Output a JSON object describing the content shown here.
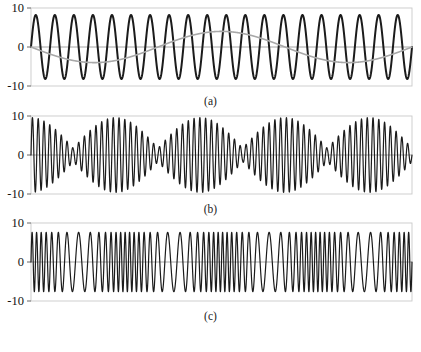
{
  "figure": {
    "width": 421,
    "height": 352,
    "background": "#ffffff"
  },
  "captions": {
    "a": "(a)",
    "b": "(b)",
    "c": "(c)"
  },
  "axis": {
    "tick_top": "10",
    "tick_mid": "0",
    "tick_bottom": "-10"
  },
  "colors": {
    "primary_wave": "#1b1b1b",
    "secondary_wave": "#a8a8a8",
    "axis_line": "#b8b8b8",
    "frame": "#c9c9c9",
    "zero_line": "#8f8f8f",
    "text": "#111111"
  },
  "chart_data": [
    {
      "type": "line",
      "title": "(a)",
      "xlabel": "",
      "ylabel": "",
      "ylim": [
        -10,
        10
      ],
      "xlim": [
        0,
        1
      ],
      "yticks": [
        10,
        0,
        -10
      ],
      "grid": false,
      "legend": "none",
      "description": "Two superimposed sinusoids: a high-frequency large-amplitude dark wave and a low-frequency smaller-amplitude gray wave.",
      "series": [
        {
          "name": "high-frequency carrier",
          "color": "#1b1b1b",
          "form": "sine",
          "amplitude": 8.2,
          "cycles": 20,
          "phase": 0,
          "offset": 0,
          "linewidth": 2.0
        },
        {
          "name": "low-frequency modulator",
          "color": "#a8a8a8",
          "form": "sine",
          "amplitude": 4.0,
          "cycles": 1.5,
          "phase": 3.14159,
          "offset": 0,
          "linewidth": 1.6
        }
      ]
    },
    {
      "type": "line",
      "title": "(b)",
      "xlabel": "",
      "ylabel": "",
      "ylim": [
        -10,
        10
      ],
      "xlim": [
        0,
        1
      ],
      "yticks": [
        10,
        0,
        -10
      ],
      "grid": false,
      "legend": "none",
      "description": "Amplitude-modulated beat signal: sum of two close-frequency sinusoids producing a slow beating envelope.",
      "series": [
        {
          "name": "beat signal",
          "color": "#1b1b1b",
          "form": "beat",
          "amplitude": 9.6,
          "carrier_cycles": 66,
          "envelope_cycles": 4.5,
          "envelope_phase": 0,
          "envelope_floor": 0.18,
          "linewidth": 1.2
        }
      ]
    },
    {
      "type": "line",
      "title": "(c)",
      "xlabel": "",
      "ylabel": "",
      "ylim": [
        -10,
        10
      ],
      "xlim": [
        0,
        1
      ],
      "yticks": [
        10,
        0,
        -10
      ],
      "grid": false,
      "legend": "none",
      "description": "Frequency-modulated signal: constant amplitude with sinusoidally varying instantaneous frequency.",
      "series": [
        {
          "name": "fm signal",
          "color": "#1b1b1b",
          "form": "fm",
          "amplitude": 7.6,
          "carrier_cycles": 58,
          "modulation_cycles": 4.0,
          "modulation_index": 7.0,
          "linewidth": 1.2
        }
      ]
    }
  ],
  "layout": {
    "panel_height": 92,
    "plot_left": 31,
    "plot_right": 412,
    "caption_height": 22
  }
}
